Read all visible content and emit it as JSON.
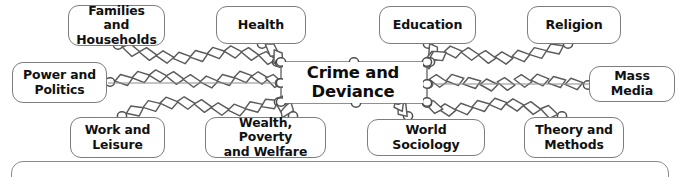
{
  "diagram": {
    "type": "concept-map",
    "centre": {
      "label": "Crime and\nDeviance",
      "x": 283,
      "y": 62,
      "width": 140,
      "height": 41
    },
    "connector_style": "hand-drawn-chain-links",
    "colors": {
      "background": "#ffffff",
      "node_border": "#7d7d7d",
      "node_fill": "#ffffff",
      "text": "#111111",
      "chain_stroke": "#5a5a5a",
      "chain_fill": "#ffffff",
      "panel_border": "#8a8a8a"
    },
    "nodes": [
      {
        "id": "families-and-households",
        "label": "Families and\nHouseholds",
        "lines": 2,
        "x": 68,
        "y": 5,
        "width": 97,
        "height": 41
      },
      {
        "id": "health",
        "label": "Health",
        "lines": 1,
        "x": 216,
        "y": 6,
        "width": 90,
        "height": 38
      },
      {
        "id": "education",
        "label": "Education",
        "lines": 1,
        "x": 379,
        "y": 6,
        "width": 97,
        "height": 38
      },
      {
        "id": "religion",
        "label": "Religion",
        "lines": 1,
        "x": 527,
        "y": 6,
        "width": 94,
        "height": 38
      },
      {
        "id": "power-and-politics",
        "label": "Power and\nPolitics",
        "lines": 2,
        "x": 12,
        "y": 62,
        "width": 95,
        "height": 41
      },
      {
        "id": "mass-media",
        "label": "Mass Media",
        "lines": 1,
        "x": 589,
        "y": 66,
        "width": 86,
        "height": 36
      },
      {
        "id": "work-and-leisure",
        "label": "Work and\nLeisure",
        "lines": 2,
        "x": 70,
        "y": 117,
        "width": 95,
        "height": 41
      },
      {
        "id": "wealth-poverty-and-welfare",
        "label": "Wealth, Poverty\nand Welfare",
        "lines": 2,
        "x": 205,
        "y": 117,
        "width": 121,
        "height": 41
      },
      {
        "id": "world-sociology",
        "label": "World Sociology",
        "lines": 1,
        "x": 367,
        "y": 119,
        "width": 118,
        "height": 37
      },
      {
        "id": "theory-and-methods",
        "label": "Theory and\nMethods",
        "lines": 2,
        "x": 524,
        "y": 117,
        "width": 100,
        "height": 41
      }
    ],
    "links": [
      {
        "from": "families-and-households",
        "to": "centre"
      },
      {
        "from": "health",
        "to": "centre"
      },
      {
        "from": "education",
        "to": "centre"
      },
      {
        "from": "religion",
        "to": "centre"
      },
      {
        "from": "power-and-politics",
        "to": "centre"
      },
      {
        "from": "mass-media",
        "to": "centre"
      },
      {
        "from": "work-and-leisure",
        "to": "centre"
      },
      {
        "from": "wealth-poverty-and-welfare",
        "to": "centre"
      },
      {
        "from": "world-sociology",
        "to": "centre"
      },
      {
        "from": "theory-and-methods",
        "to": "centre"
      }
    ],
    "bottom_panel": {
      "label": "",
      "x": 11,
      "y": 161,
      "width": 658,
      "height": 40
    }
  }
}
